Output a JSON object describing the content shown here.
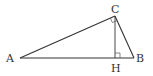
{
  "diagram": {
    "type": "geometry-triangle",
    "colors": {
      "stroke": "#333333",
      "background": "#ffffff"
    },
    "points": {
      "A": {
        "label": "A",
        "x": 20,
        "y": 58
      },
      "B": {
        "label": "B",
        "x": 134,
        "y": 58
      },
      "C": {
        "label": "C",
        "x": 115,
        "y": 16
      },
      "H": {
        "label": "H",
        "x": 115,
        "y": 58
      }
    },
    "labels": {
      "A": "A",
      "B": "B",
      "C": "C",
      "H": "H"
    },
    "segments": [
      {
        "from": "A",
        "to": "B"
      },
      {
        "from": "A",
        "to": "C"
      },
      {
        "from": "C",
        "to": "B"
      },
      {
        "from": "C",
        "to": "H"
      }
    ],
    "right_angles": [
      "C",
      "H"
    ]
  }
}
